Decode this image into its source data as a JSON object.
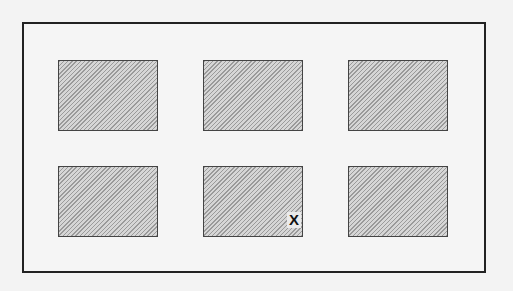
{
  "diagram": {
    "type": "grid-layout",
    "rows": 2,
    "columns": 3,
    "cells": [
      {
        "row": 1,
        "col": 1,
        "label": ""
      },
      {
        "row": 1,
        "col": 2,
        "label": ""
      },
      {
        "row": 1,
        "col": 3,
        "label": ""
      },
      {
        "row": 2,
        "col": 1,
        "label": ""
      },
      {
        "row": 2,
        "col": 2,
        "label": "X"
      },
      {
        "row": 2,
        "col": 3,
        "label": ""
      }
    ],
    "fill_pattern": "diagonal-hatch",
    "colors": {
      "border": "#222222",
      "hatch": "#9a9a9a",
      "background": "#f3f3f3"
    }
  }
}
